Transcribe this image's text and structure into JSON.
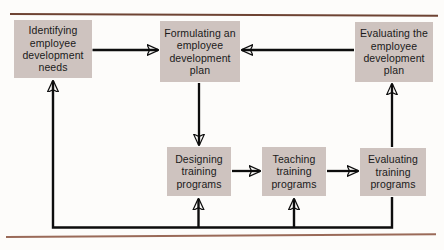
{
  "page": {
    "background_color": "#fdfcfa",
    "rule_color": "#7a4a38",
    "node_fill": "#cec3bf",
    "connector_color": "#0d0d0d"
  },
  "nodes": [
    {
      "id": "identifying-needs",
      "label": "Identifying employee development needs"
    },
    {
      "id": "formulating-plan",
      "label": "Formulating an employee development plan"
    },
    {
      "id": "evaluating-plan",
      "label": "Evaluating the employee development plan"
    },
    {
      "id": "designing-training",
      "label": "Designing training programs"
    },
    {
      "id": "teaching-training",
      "label": "Teaching training programs"
    },
    {
      "id": "evaluating-training",
      "label": "Evaluating training programs"
    }
  ],
  "connectors": [
    {
      "from": "identifying-needs",
      "to": "formulating-plan",
      "direction": "right"
    },
    {
      "from": "formulating-plan",
      "to": "designing-training",
      "direction": "down"
    },
    {
      "from": "designing-training",
      "to": "teaching-training",
      "direction": "right"
    },
    {
      "from": "teaching-training",
      "to": "evaluating-training",
      "direction": "right"
    },
    {
      "from": "evaluating-training",
      "to": "evaluating-plan",
      "direction": "up"
    },
    {
      "from": "evaluating-plan",
      "to": "formulating-plan",
      "direction": "left"
    },
    {
      "from": "evaluating-training",
      "to": "identifying-needs",
      "direction": "feedback-left"
    },
    {
      "from": "evaluating-training",
      "to": "designing-training",
      "direction": "feedback-up"
    },
    {
      "from": "evaluating-training",
      "to": "teaching-training",
      "direction": "feedback-up"
    }
  ],
  "rules": {
    "top": "horizontal-rule-top",
    "bottom": "horizontal-rule-bottom"
  }
}
